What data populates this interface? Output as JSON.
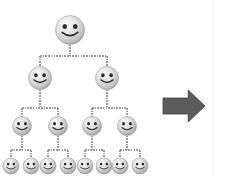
{
  "image": {
    "title": "Hierarchical Organization Tree with Smiley Nodes",
    "width": 226,
    "height": 176,
    "background_color": "#ffffff",
    "description": "Binary tree diagram of grayscale smiley-face nodes connected by dashed gray lines, with a dark gray right-pointing arrow at the right"
  },
  "palette": {
    "background": "#ffffff",
    "edge_color": "#9a9a9a",
    "arrow_fill": "#5c5c5c",
    "arrow_stroke": "#3f3f3f",
    "face_light": "#f2f2f2",
    "face_mid": "#c9c9c9",
    "face_dark": "#8f8f8f",
    "feature_color": "#2a2a2a",
    "frame_color": "#f0efed"
  },
  "tree": {
    "name": "smiley-hierarchy-tree",
    "levels": 4,
    "total_nodes": 15,
    "branching_factor": 2,
    "node_counts": [
      1,
      2,
      4,
      8
    ],
    "nodes": [
      {
        "id": "n0",
        "label": "root",
        "level": 0,
        "cx": 70,
        "cy": 30,
        "r": 14.5
      },
      {
        "id": "n1",
        "label": "L2-1",
        "level": 1,
        "cx": 40,
        "cy": 78,
        "r": 11.5
      },
      {
        "id": "n2",
        "label": "L2-2",
        "level": 1,
        "cx": 107,
        "cy": 78,
        "r": 11.5
      },
      {
        "id": "n3",
        "label": "L3-1",
        "level": 2,
        "cx": 22,
        "cy": 126,
        "r": 9.5
      },
      {
        "id": "n4",
        "label": "L3-2",
        "level": 2,
        "cx": 58,
        "cy": 126,
        "r": 9.5
      },
      {
        "id": "n5",
        "label": "L3-3",
        "level": 2,
        "cx": 92,
        "cy": 126,
        "r": 9.5
      },
      {
        "id": "n6",
        "label": "L3-4",
        "level": 2,
        "cx": 127,
        "cy": 126,
        "r": 9.5
      },
      {
        "id": "n7",
        "label": "L4-1",
        "level": 3,
        "cx": 11,
        "cy": 166,
        "r": 8
      },
      {
        "id": "n8",
        "label": "L4-2",
        "level": 3,
        "cx": 31,
        "cy": 166,
        "r": 8
      },
      {
        "id": "n9",
        "label": "L4-3",
        "level": 3,
        "cx": 48,
        "cy": 166,
        "r": 8
      },
      {
        "id": "n10",
        "label": "L4-4",
        "level": 3,
        "cx": 68,
        "cy": 166,
        "r": 8
      },
      {
        "id": "n11",
        "label": "L4-5",
        "level": 3,
        "cx": 85,
        "cy": 166,
        "r": 8
      },
      {
        "id": "n12",
        "label": "L4-6",
        "level": 3,
        "cx": 104,
        "cy": 166,
        "r": 8
      },
      {
        "id": "n13",
        "label": "L4-7",
        "level": 3,
        "cx": 120,
        "cy": 166,
        "r": 8
      },
      {
        "id": "n14",
        "label": "L4-8",
        "level": 3,
        "cx": 140,
        "cy": 166,
        "r": 8
      }
    ],
    "edges": [
      {
        "from": "n0",
        "to": "n1",
        "stem_down": 16,
        "bus_y": 56
      },
      {
        "from": "n0",
        "to": "n2",
        "stem_down": 16,
        "bus_y": 56
      },
      {
        "from": "n1",
        "to": "n3",
        "stem_down": 14,
        "bus_y": 108
      },
      {
        "from": "n1",
        "to": "n4",
        "stem_down": 14,
        "bus_y": 108
      },
      {
        "from": "n2",
        "to": "n5",
        "stem_down": 14,
        "bus_y": 108
      },
      {
        "from": "n2",
        "to": "n6",
        "stem_down": 14,
        "bus_y": 108
      },
      {
        "from": "n3",
        "to": "n7",
        "stem_down": 12,
        "bus_y": 150
      },
      {
        "from": "n3",
        "to": "n8",
        "stem_down": 12,
        "bus_y": 150
      },
      {
        "from": "n4",
        "to": "n9",
        "stem_down": 12,
        "bus_y": 150
      },
      {
        "from": "n4",
        "to": "n10",
        "stem_down": 12,
        "bus_y": 150
      },
      {
        "from": "n5",
        "to": "n11",
        "stem_down": 12,
        "bus_y": 150
      },
      {
        "from": "n5",
        "to": "n12",
        "stem_down": 12,
        "bus_y": 150
      },
      {
        "from": "n6",
        "to": "n13",
        "stem_down": 12,
        "bus_y": 150
      },
      {
        "from": "n6",
        "to": "n14",
        "stem_down": 12,
        "bus_y": 150
      }
    ]
  },
  "arrow": {
    "name": "right-arrow",
    "direction": "right",
    "x": 163,
    "y": 90,
    "width": 42,
    "height": 32,
    "fill": "#5c5c5c"
  },
  "frame": {
    "right_edge_x": 213,
    "visible": true
  }
}
